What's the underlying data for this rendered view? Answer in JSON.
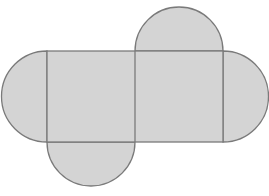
{
  "diagram": {
    "colors": {
      "fill": "#d4d4d4",
      "stroke": "#7a7a7a",
      "background": "#ffffff"
    },
    "rectangle": {
      "x": 47,
      "y": 51,
      "width": 176,
      "height": 91
    },
    "divider_x": 135,
    "semicircles": [
      {
        "name": "top-flap",
        "cx": 179,
        "cy": 51,
        "r": 44,
        "side": "top"
      },
      {
        "name": "bottom-flap",
        "cx": 91,
        "cy": 142,
        "r": 44,
        "side": "bottom"
      },
      {
        "name": "left-flap",
        "cx": 47,
        "cy": 96.5,
        "r": 45.5,
        "side": "left"
      },
      {
        "name": "right-flap",
        "cx": 223,
        "cy": 96.5,
        "r": 45.5,
        "side": "right"
      }
    ]
  }
}
